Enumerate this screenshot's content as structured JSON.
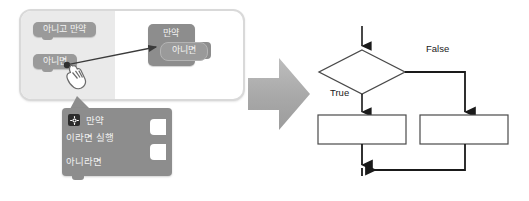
{
  "left_panel": {
    "name": "block-editor-illustration",
    "palette_blocks": [
      {
        "id": "else-if",
        "label": "아니고 만약"
      },
      {
        "id": "else",
        "label": "아니면"
      }
    ],
    "target_block": {
      "id": "if-block",
      "label": "만약",
      "slot_label": "아니면"
    },
    "drag_action": "drag-else-block-into-if-slot",
    "cursor": "hand-pointer",
    "callout_block": {
      "id": "if-else-block",
      "gear_icon": "gear-icon",
      "lines": [
        "만약",
        "이라면 실행",
        "아니라면"
      ]
    }
  },
  "transition": {
    "icon": "right-arrow-icon",
    "color": "#a6a6a6"
  },
  "flowchart": {
    "type": "if-else",
    "decision": {
      "shape": "diamond",
      "label": ""
    },
    "branches": [
      {
        "label": "True",
        "box": ""
      },
      {
        "label": "False",
        "box": ""
      }
    ],
    "stroke": "#1a1a1a",
    "fill": "#ffffff"
  },
  "colors": {
    "block_gray": "#8d8d8d",
    "block_gray_light": "#9a9a9a",
    "card_shade": "#eaeaea",
    "card_border": "#d9d9d9",
    "arrow_gray": "#a6a6a6",
    "line_black": "#1a1a1a"
  }
}
